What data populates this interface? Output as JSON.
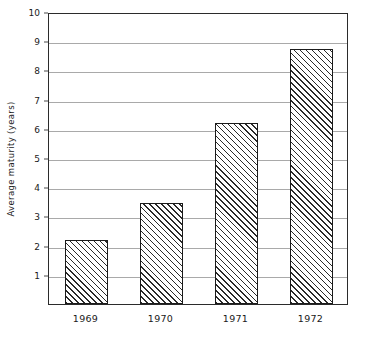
{
  "chart_data": {
    "type": "bar",
    "title": "",
    "subtitle": "",
    "xlabel": "",
    "ylabel": "Average maturity (years)",
    "categories": [
      "1969",
      "1970",
      "1971",
      "1972"
    ],
    "values": [
      2.2,
      3.45,
      6.2,
      8.75
    ],
    "series": [
      {
        "name": "Average maturity",
        "values": [
          2.2,
          3.45,
          6.2,
          8.75
        ]
      }
    ],
    "ylim": [
      0,
      10
    ],
    "y_ticks": [
      1,
      2,
      3,
      4,
      5,
      6,
      7,
      8,
      9,
      10
    ],
    "y_tick_labels": [
      "1",
      "2",
      "3",
      "4",
      "5",
      "6",
      "7",
      "8",
      "9",
      "10"
    ],
    "grid": true,
    "grid_axis": "y",
    "legend": false,
    "legend_position": "none",
    "bar_fill": "diagonal-hatch",
    "bar_edge_color": "#1b1b1b",
    "grid_color": "#a9a9a9",
    "frame_color": "#2b2b2b",
    "background": "#ffffff"
  },
  "axes": {
    "y_title": "Average maturity (years)"
  }
}
